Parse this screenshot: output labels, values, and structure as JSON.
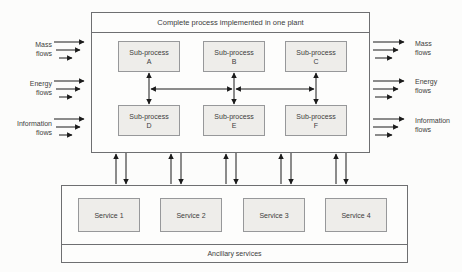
{
  "plant": {
    "title": "Complete process implemented in one plant",
    "subprocesses": [
      {
        "name": "Sub-process",
        "id": "A"
      },
      {
        "name": "Sub-process",
        "id": "B"
      },
      {
        "name": "Sub-process",
        "id": "C"
      },
      {
        "name": "Sub-process",
        "id": "D"
      },
      {
        "name": "Sub-process",
        "id": "E"
      },
      {
        "name": "Sub-process",
        "id": "F"
      }
    ]
  },
  "flows_left": [
    {
      "line1": "Mass",
      "line2": "flows"
    },
    {
      "line1": "Energy",
      "line2": "flows"
    },
    {
      "line1": "Information",
      "line2": "flows"
    }
  ],
  "flows_right": [
    {
      "line1": "Mass",
      "line2": "flows"
    },
    {
      "line1": "Energy",
      "line2": "flows"
    },
    {
      "line1": "Information",
      "line2": "flows"
    }
  ],
  "services": {
    "label": "Ancillary services",
    "items": [
      {
        "label": "Service 1"
      },
      {
        "label": "Service 2"
      },
      {
        "label": "Service 3"
      },
      {
        "label": "Service 4"
      }
    ]
  },
  "icons": {
    "arrowhead": "solid black triangle arrowhead"
  },
  "colors": {
    "background": "#fcfcfb",
    "box_fill": "#eeedea",
    "outer_border": "#6e6f71",
    "inner_border": "#97989a",
    "arrow": "#1b1b1b",
    "text": "#3c3c3c"
  }
}
